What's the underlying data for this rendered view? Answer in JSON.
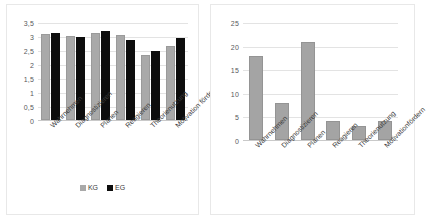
{
  "figure": {
    "background": "#ffffff",
    "panel_border": "#e8e8e8"
  },
  "legend": {
    "items": [
      {
        "label": "KG",
        "color": "#a9a9a9"
      },
      {
        "label": "EG",
        "color": "#0d0d0d"
      }
    ]
  },
  "chart_data": [
    {
      "type": "bar",
      "title": "",
      "xlabel": "",
      "ylabel": "",
      "grid": true,
      "legend_position": "bottom",
      "ylim": [
        0,
        3.5
      ],
      "yticks": [
        "0",
        "0,5",
        "1",
        "1,5",
        "2",
        "2,5",
        "3",
        "3,5"
      ],
      "ytick_values": [
        0,
        0.5,
        1,
        1.5,
        2,
        2.5,
        3,
        3.5
      ],
      "categories": [
        "Wahrnehmen",
        "Diagnostizieren",
        "Planen",
        "Reagieren",
        "Theorienutzung",
        "Motivation fördern"
      ],
      "series": [
        {
          "name": "KG",
          "color": "#a9a9a9",
          "values": [
            3.1,
            3.03,
            3.15,
            3.07,
            2.33,
            2.68
          ]
        },
        {
          "name": "EG",
          "color": "#0d0d0d",
          "values": [
            3.15,
            3.0,
            3.22,
            2.9,
            2.48,
            2.95
          ]
        }
      ]
    },
    {
      "type": "bar",
      "title": "",
      "xlabel": "",
      "ylabel": "",
      "grid": true,
      "legend_position": "none",
      "ylim": [
        0,
        25
      ],
      "yticks": [
        "0",
        "5",
        "10",
        "15",
        "20",
        "25"
      ],
      "ytick_values": [
        0,
        5,
        10,
        15,
        20,
        25
      ],
      "categories": [
        "Wahrnehmen",
        "Diagnostizieren",
        "Planen",
        "Reagieren",
        "Theorienutzung",
        "Motivationfördern"
      ],
      "series": [
        {
          "name": "Anzahl",
          "color": "#a4a4a4",
          "values": [
            18,
            8,
            21,
            4,
            3,
            4
          ]
        }
      ]
    }
  ]
}
